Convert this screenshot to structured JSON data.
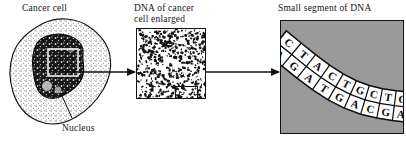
{
  "figure": {
    "background_color": "#ffffff",
    "ink_color": "#111111",
    "panel_fill_gray": "#9a9a9a"
  },
  "panels": {
    "cell": {
      "label": "Cancer cell",
      "nucleus_label": "Nucleus",
      "cytoplasm_pattern": "stippled",
      "nucleus_fill": "#1a1a1a",
      "callout_box": "white-square-on-nucleus"
    },
    "enlarged": {
      "label_line1": "DNA of cancer",
      "label_line2": "cell enlarged",
      "texture": "dense-mottled-noise",
      "callout_box": "inner-square"
    },
    "segment": {
      "label": "Small segment of DNA",
      "background": "#9a9a9a",
      "ladder_fill": "#ffffff"
    }
  },
  "arrows": {
    "arrow1_name": "arrow-cell-to-enlarged",
    "arrow2_name": "arrow-enlarged-to-segment"
  },
  "chart_data": {
    "type": "diagram",
    "title": "Small segment of DNA",
    "representation": "double-stranded DNA ladder with paired nucleotide bases",
    "top_strand": [
      "A",
      "G",
      "A",
      "T",
      "G",
      "A",
      "C",
      "G",
      "A"
    ],
    "bottom_strand": [
      "C",
      "T",
      "A",
      "C",
      "T",
      "G",
      "C",
      "T",
      "G"
    ],
    "base_pairs": [
      {
        "top": "A",
        "bottom": "C",
        "partial": true
      },
      {
        "top": "G",
        "bottom": "T",
        "partial": false
      },
      {
        "top": "A",
        "bottom": "A",
        "partial": false
      },
      {
        "top": "T",
        "bottom": "C",
        "partial": false
      },
      {
        "top": "G",
        "bottom": "T",
        "partial": false
      },
      {
        "top": "A",
        "bottom": "G",
        "partial": false
      },
      {
        "top": "C",
        "bottom": "C",
        "partial": false
      },
      {
        "top": "G",
        "bottom": "T",
        "partial": false
      },
      {
        "top": "A",
        "bottom": "G",
        "partial": true
      }
    ],
    "orientation": "S-curve running upper-left to lower-right",
    "pair_count": 9
  }
}
